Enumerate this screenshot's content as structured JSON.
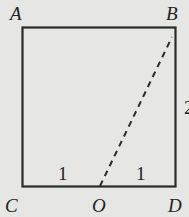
{
  "diagram": {
    "type": "geometry",
    "shape": "rectangle",
    "vertices": {
      "A": "A",
      "B": "B",
      "C": "C",
      "D": "D",
      "O": "O"
    },
    "segment_labels": {
      "CO": "1",
      "OD": "1",
      "BD": "2"
    },
    "dashed_segment": "OB",
    "colors": {
      "background": "#e6e6e4",
      "stroke": "#2a2a2a"
    }
  }
}
